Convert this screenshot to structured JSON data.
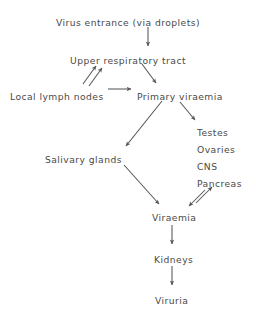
{
  "diagram": {
    "title": "Virus entrance (via droplets)",
    "type": "flowchart",
    "background_color": "#ffffff",
    "text_color": "#4a4a4a",
    "arrow_color": "#555555",
    "nodes": [
      {
        "id": "entrance",
        "label": "Virus entrance (via droplets)",
        "x": 128,
        "y": 18,
        "align": "center"
      },
      {
        "id": "urt",
        "label": "Upper respiratory tract",
        "x": 128,
        "y": 56,
        "align": "center"
      },
      {
        "id": "lymph",
        "label": "Local lymph nodes",
        "x": 10,
        "y": 92,
        "align": "left"
      },
      {
        "id": "primary",
        "label": "Primary viraemia",
        "x": 137,
        "y": 92,
        "align": "left"
      },
      {
        "id": "testes",
        "label": "Testes",
        "x": 197,
        "y": 128,
        "align": "left"
      },
      {
        "id": "ovaries",
        "label": "Ovaries",
        "x": 197,
        "y": 145,
        "align": "left"
      },
      {
        "id": "cns",
        "label": "CNS",
        "x": 197,
        "y": 162,
        "align": "left"
      },
      {
        "id": "pancreas",
        "label": "Pancreas",
        "x": 197,
        "y": 179,
        "align": "left"
      },
      {
        "id": "salivary",
        "label": "Salivary glands",
        "x": 45,
        "y": 155,
        "align": "left"
      },
      {
        "id": "viraemia",
        "label": "Viraemia",
        "x": 152,
        "y": 213,
        "align": "left"
      },
      {
        "id": "kidneys",
        "label": "Kidneys",
        "x": 154,
        "y": 255,
        "align": "left"
      },
      {
        "id": "viruria",
        "label": "Viruria",
        "x": 155,
        "y": 296,
        "align": "left"
      }
    ],
    "edges": [
      {
        "id": "entrance-to-urt",
        "from": "entrance",
        "to": "urt",
        "x1": 148,
        "y1": 27,
        "x2": 148,
        "y2": 46,
        "kind": "vertical"
      },
      {
        "id": "lymph-to-urt-a",
        "from": "lymph",
        "to": "urt",
        "x1": 83,
        "y1": 84,
        "x2": 96,
        "y2": 66,
        "kind": "diagonal"
      },
      {
        "id": "lymph-to-urt-b",
        "from": "lymph",
        "to": "urt",
        "x1": 89,
        "y1": 86,
        "x2": 102,
        "y2": 68,
        "kind": "diagonal"
      },
      {
        "id": "urt-to-primary",
        "from": "urt",
        "to": "primary",
        "x1": 142,
        "y1": 64,
        "x2": 156,
        "y2": 83,
        "kind": "diagonal"
      },
      {
        "id": "lymph-to-primary",
        "from": "lymph",
        "to": "primary",
        "x1": 108,
        "y1": 89,
        "x2": 131,
        "y2": 89,
        "kind": "horizontal"
      },
      {
        "id": "primary-to-organs",
        "from": "primary",
        "to": "testes",
        "x1": 180,
        "y1": 102,
        "x2": 195,
        "y2": 120,
        "kind": "diagonal"
      },
      {
        "id": "primary-to-salivary",
        "from": "primary",
        "to": "salivary",
        "x1": 162,
        "y1": 101,
        "x2": 126,
        "y2": 146,
        "kind": "diagonal"
      },
      {
        "id": "salivary-to-viraemia",
        "from": "salivary",
        "to": "viraemia",
        "x1": 124,
        "y1": 165,
        "x2": 159,
        "y2": 204,
        "kind": "diagonal"
      },
      {
        "id": "organs-to-viraemia",
        "from": "pancreas",
        "to": "viraemia",
        "x1": 196,
        "y1": 203,
        "x2": 212,
        "y2": 187,
        "kind": "diagonal"
      },
      {
        "id": "viraemia-to-organs",
        "from": "viraemia",
        "to": "pancreas",
        "x1": 205,
        "y1": 190,
        "x2": 189,
        "y2": 206,
        "kind": "diagonal"
      },
      {
        "id": "viraemia-to-kidneys",
        "from": "viraemia",
        "to": "kidneys",
        "x1": 172,
        "y1": 225,
        "x2": 172,
        "y2": 244,
        "kind": "vertical"
      },
      {
        "id": "kidneys-to-viruria",
        "from": "kidneys",
        "to": "viruria",
        "x1": 172,
        "y1": 266,
        "x2": 172,
        "y2": 285,
        "kind": "vertical"
      }
    ]
  }
}
